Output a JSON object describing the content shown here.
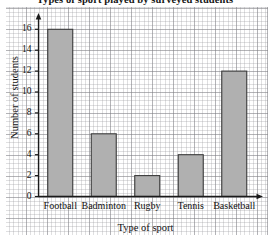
{
  "chart_data": {
    "type": "bar",
    "title": "Types of sport played by surveyed students",
    "xlabel": "Type of sport",
    "ylabel": "Number of students",
    "categories": [
      "Football",
      "Badminton",
      "Rugby",
      "Tennis",
      "Basketball"
    ],
    "values": [
      16,
      6,
      2,
      4,
      12
    ],
    "ylim": [
      0,
      17
    ],
    "yticks": [
      0,
      2,
      4,
      6,
      8,
      10,
      12,
      14,
      16
    ],
    "ytick_labels": [
      "0",
      "2",
      "4",
      "6",
      "8",
      "10",
      "12",
      "14",
      "16"
    ],
    "grid": true,
    "grid_style": "graph-paper",
    "legend": "none",
    "bar_color": "#b0b0b0",
    "bar_edge_color": "#3a3a3a",
    "axis_color": "#1a1a1a"
  }
}
